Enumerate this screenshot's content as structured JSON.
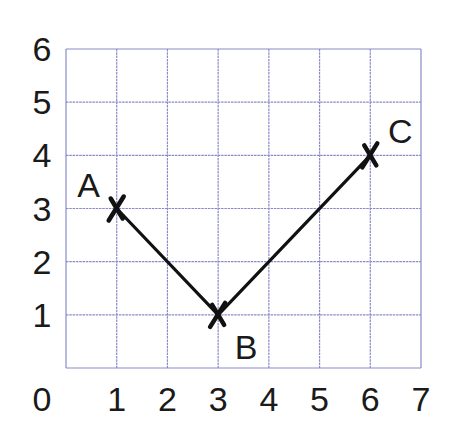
{
  "chart_data": {
    "type": "line",
    "title": "",
    "xlabel": "",
    "ylabel": "",
    "xlim": [
      0,
      7
    ],
    "ylim": [
      0,
      6
    ],
    "grid": true,
    "x_ticks": [
      "0",
      "1",
      "2",
      "3",
      "4",
      "5",
      "6",
      "7"
    ],
    "y_ticks": [
      "1",
      "2",
      "3",
      "4",
      "5",
      "6"
    ],
    "series": [
      {
        "name": "A-B-C",
        "points": [
          {
            "label": "A",
            "x": 1,
            "y": 3
          },
          {
            "label": "B",
            "x": 3,
            "y": 1
          },
          {
            "label": "C",
            "x": 6,
            "y": 4
          }
        ]
      }
    ],
    "markers": "cross",
    "colors": {
      "grid": "#8a8ac8",
      "line": "#111111",
      "text": "#1a1a1a"
    }
  }
}
